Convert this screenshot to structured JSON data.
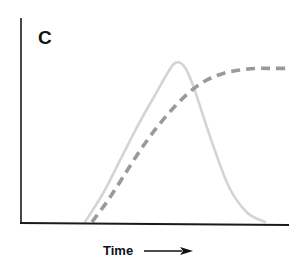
{
  "chart_data": {
    "type": "line",
    "title": "",
    "panel_label": "C",
    "xlabel": "Time",
    "ylabel": "",
    "xlim": [
      0,
      100
    ],
    "ylim": [
      0,
      100
    ],
    "grid": false,
    "legend": "none",
    "x_ticks": [],
    "y_ticks": [],
    "series": [
      {
        "name": "transient-peak",
        "style": "solid",
        "color": "#d4d4d4",
        "x": [
          0,
          10,
          20,
          30,
          40,
          45,
          50,
          55,
          60,
          70,
          80,
          90,
          100
        ],
        "y": [
          0,
          18,
          40,
          62,
          82,
          92,
          100,
          98,
          86,
          52,
          22,
          6,
          0
        ]
      },
      {
        "name": "sigmoid-rise",
        "style": "dashed",
        "color": "#9a9a9a",
        "x": [
          0,
          10,
          20,
          30,
          40,
          50,
          60,
          70,
          80,
          90,
          100,
          110,
          120
        ],
        "y": [
          0,
          14,
          30,
          46,
          60,
          72,
          82,
          89,
          93,
          95,
          96,
          96,
          96
        ]
      }
    ]
  },
  "labels": {
    "panel": "C",
    "x_axis": "Time"
  },
  "colors": {
    "axis": "#1a1a1a",
    "solid_series": "#d4d4d4",
    "dashed_series": "#9a9a9a"
  }
}
